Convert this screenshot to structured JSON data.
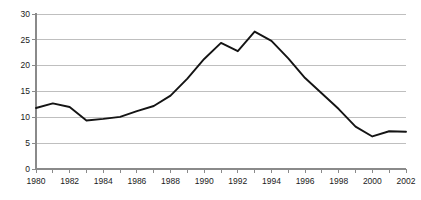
{
  "chart_data": {
    "type": "line",
    "title": "",
    "subtitle": "",
    "xlabel": "",
    "ylabel": "",
    "xlim": [
      1980,
      2002
    ],
    "ylim": [
      0,
      30
    ],
    "grid": true,
    "legend": false,
    "legend_position": "none",
    "yticks": [
      0,
      5,
      10,
      15,
      20,
      25,
      30
    ],
    "ytick_labels": [
      "0",
      "5",
      "10",
      "15",
      "20",
      "25",
      "30"
    ],
    "xticks": [
      1980,
      1982,
      1984,
      1986,
      1988,
      1990,
      1992,
      1994,
      1996,
      1998,
      2000,
      2002
    ],
    "xtick_labels": [
      "1980",
      "1982",
      "1984",
      "1986",
      "1988",
      "1990",
      "1992",
      "1994",
      "1996",
      "1998",
      "2000",
      "2002"
    ],
    "xtick_minor": [
      1981,
      1983,
      1985,
      1987,
      1989,
      1991,
      1993,
      1995,
      1997,
      1999,
      2001
    ],
    "x": [
      1980,
      1981,
      1982,
      1983,
      1984,
      1985,
      1986,
      1987,
      1988,
      1989,
      1990,
      1991,
      1992,
      1993,
      1994,
      1995,
      1996,
      1997,
      1998,
      1999,
      2000,
      2001,
      2002
    ],
    "values": [
      11.8,
      12.7,
      12.0,
      9.4,
      9.7,
      10.1,
      11.2,
      12.2,
      14.2,
      17.5,
      21.3,
      24.4,
      22.8,
      26.6,
      24.8,
      21.4,
      17.6,
      14.6,
      11.6,
      8.2,
      6.3,
      7.3,
      7.2
    ],
    "series": [
      {
        "name": "series-1",
        "color": "#141414",
        "values": [
          11.8,
          12.7,
          12.0,
          9.4,
          9.7,
          10.1,
          11.2,
          12.2,
          14.2,
          17.5,
          21.3,
          24.4,
          22.8,
          26.6,
          24.8,
          21.4,
          17.6,
          14.6,
          11.6,
          8.2,
          6.3,
          7.3,
          7.2
        ]
      }
    ],
    "annotations": [],
    "colors": {
      "line": "#141414",
      "grid": "#b8b8b8",
      "axis": "#8a8a8a",
      "text": "#1a1a1a",
      "background": "#ffffff"
    }
  }
}
